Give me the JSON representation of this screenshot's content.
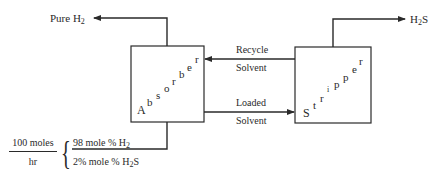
{
  "diagram": {
    "type": "process-flow",
    "units": {
      "absorber": {
        "label": "Absorber",
        "letters": [
          "A",
          "b",
          "s",
          "o",
          "r",
          "b",
          "e",
          "r"
        ]
      },
      "stripper": {
        "label": "Stripper",
        "letters": [
          "S",
          "t",
          "r",
          "i",
          "p",
          "p",
          "e",
          "r"
        ]
      }
    },
    "streams": {
      "pure_h2": {
        "label": "Pure H",
        "sub": "2"
      },
      "h2s": {
        "label": "H",
        "sub": "2",
        "suffix": "S"
      },
      "recycle": {
        "line1": "Recycle",
        "line2": "Solvent"
      },
      "loaded": {
        "line1": "Loaded",
        "line2": "Solvent"
      }
    },
    "feed": {
      "rate_numerator": "100 moles",
      "rate_denominator": "hr",
      "comp1": {
        "text": "98  mole % H",
        "sub": "2",
        "suffix": ""
      },
      "comp2": {
        "text": "2% mole % H",
        "sub": "2",
        "suffix": "S"
      }
    },
    "colors": {
      "line": "#2a2a2a",
      "background": "#ffffff"
    }
  }
}
